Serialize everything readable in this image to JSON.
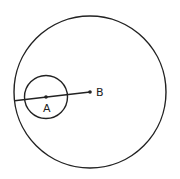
{
  "diagram": {
    "background": "#ffffff",
    "stroke_color": "#222222",
    "big_circle": {
      "cx": 90,
      "cy": 92,
      "r": 76
    },
    "small_circle": {
      "cx": 46,
      "cy": 97,
      "r": 21.5
    },
    "segment": {
      "x1": 14.5,
      "y1": 100.7,
      "x2": 90,
      "y2": 92
    },
    "points": [
      {
        "id": "A",
        "label": "A",
        "x": 46,
        "y": 97,
        "label_x": 43,
        "label_y": 112
      },
      {
        "id": "B",
        "label": "B",
        "x": 90,
        "y": 92,
        "label_x": 96,
        "label_y": 96
      }
    ]
  }
}
